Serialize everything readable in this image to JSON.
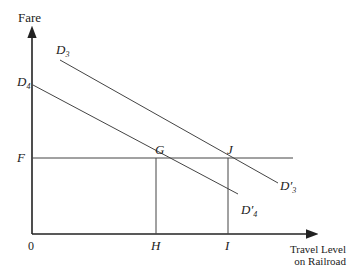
{
  "diagram": {
    "y_axis_label": "Fare",
    "x_axis_label_line1": "Travel Level",
    "x_axis_label_line2": "on Railroad",
    "origin_label": "0",
    "fare_label": "F",
    "point_g": "G",
    "point_j": "J",
    "point_h": "H",
    "point_i": "I",
    "curves": {
      "d3": {
        "base": "D",
        "prime": "",
        "sub": "3"
      },
      "d4": {
        "base": "D",
        "prime": "",
        "sub": "4"
      },
      "d3_prime": {
        "base": "D",
        "prime": "′",
        "sub": "3"
      },
      "d4_prime": {
        "base": "D",
        "prime": "′",
        "sub": "4"
      }
    },
    "colors": {
      "line": "#333333",
      "axis": "#222222"
    }
  }
}
